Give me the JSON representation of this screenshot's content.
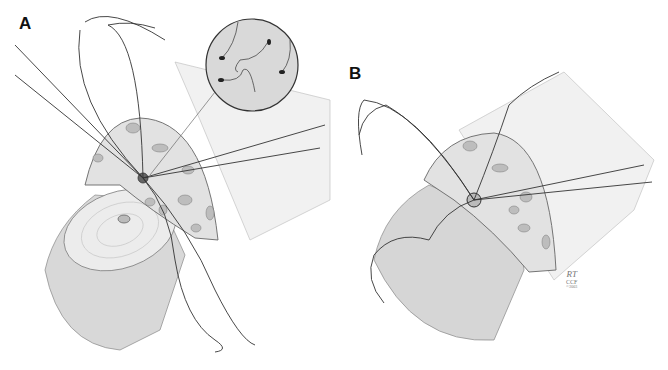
{
  "figure": {
    "panels": [
      {
        "label": "A",
        "description": "Needles passed through a tissue flap around a central opening; magnified inset showing sperm cells"
      },
      {
        "label": "B",
        "description": "Sutures tied at the anastomosis site"
      }
    ],
    "signature": {
      "initials": "RT",
      "org": "CCF",
      "year": "©2003"
    },
    "colors": {
      "background": "#ffffff",
      "line": "#333333",
      "shade": "#c9c9c9",
      "tissue": "#e4e4e4"
    }
  }
}
